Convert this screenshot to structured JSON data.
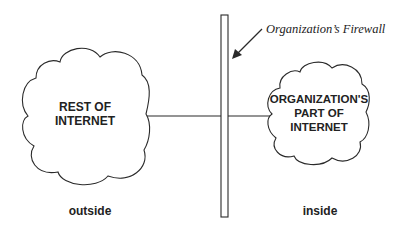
{
  "diagram": {
    "firewall_label": "Organization’s Firewall",
    "left_cloud": {
      "line1": "REST OF",
      "line2": "INTERNET"
    },
    "right_cloud": {
      "line1": "ORGANIZATION'S",
      "line2": "PART OF",
      "line3": "INTERNET"
    },
    "outside_label": "outside",
    "inside_label": "inside",
    "colors": {
      "stroke": "#2a2a2a",
      "background": "#ffffff",
      "text": "#222222"
    }
  }
}
